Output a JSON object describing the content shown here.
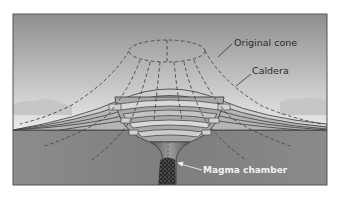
{
  "diagram": {
    "labels": {
      "original_cone": "Original cone",
      "caldera": "Caldera",
      "magma_chamber": "Magma chamber"
    },
    "colors": {
      "sky_top": "#8f8f8f",
      "sky_bottom": "#f2f2f2",
      "distant_hills": "#c9c9c9",
      "ground": "#8a8a8a",
      "strata_light": "#d4d4d4",
      "strata_mid": "#b3b3b3",
      "strata_line": "#4a4a4a",
      "frame": "#555555",
      "dashed_outline": "#444444",
      "magma": "#2a2a2a"
    }
  }
}
